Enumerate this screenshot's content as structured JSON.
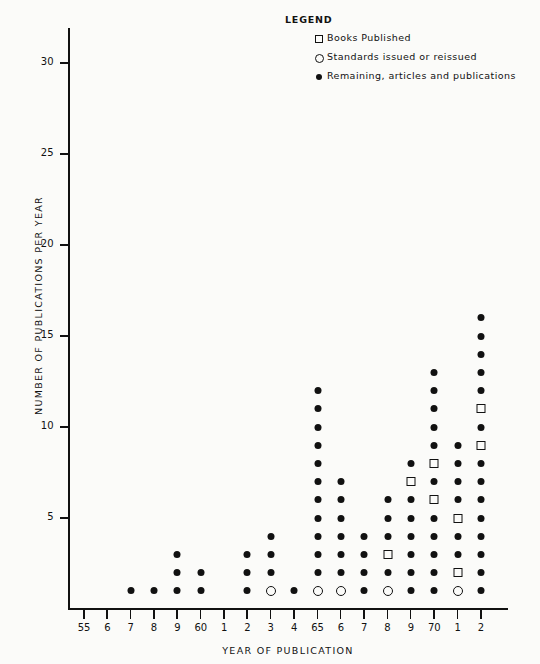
{
  "legend": {
    "title": "LEGEND",
    "entries": [
      {
        "marker": "square-marker",
        "label": "Books Published"
      },
      {
        "marker": "circle-marker",
        "label": "Standards issued or reissued"
      },
      {
        "marker": "dot-marker",
        "label": "Remaining, articles and publications"
      }
    ]
  },
  "chart_data": {
    "type": "scatter",
    "title": "",
    "xlabel": "YEAR OF PUBLICATION",
    "ylabel": "NUMBER OF PUBLICATIONS PER YEAR",
    "ylim": [
      0,
      33
    ],
    "yticks": [
      5,
      10,
      15,
      20,
      25,
      30
    ],
    "ytick_labels": [
      "5",
      "10",
      "15",
      "20",
      "25",
      "30"
    ],
    "grid": false,
    "legend_position": "top-right",
    "x": [
      1955,
      1956,
      1957,
      1958,
      1959,
      1960,
      1961,
      1962,
      1963,
      1964,
      1965,
      1966,
      1967,
      1968,
      1969,
      1970,
      1971,
      1972
    ],
    "xtick_labels": [
      "55",
      "6",
      "7",
      "8",
      "9",
      "60",
      "1",
      "2",
      "3",
      "4",
      "65",
      "6",
      "7",
      "8",
      "9",
      "70",
      "1",
      "2"
    ],
    "marker_types": [
      "dot",
      "square",
      "circle"
    ],
    "series": [
      {
        "name": "Total publications per year",
        "values": [
          0,
          0,
          1,
          1,
          3,
          2,
          0,
          3,
          4,
          1,
          12,
          7,
          4,
          6,
          8,
          13,
          9,
          16
        ]
      },
      {
        "name": "Books Published",
        "values": [
          0,
          0,
          0,
          0,
          0,
          0,
          0,
          0,
          0,
          0,
          0,
          0,
          0,
          1,
          1,
          2,
          2,
          2
        ]
      },
      {
        "name": "Standards issued or reissued",
        "values": [
          0,
          0,
          0,
          0,
          0,
          0,
          0,
          0,
          1,
          0,
          1,
          1,
          0,
          1,
          0,
          0,
          1,
          0
        ]
      },
      {
        "name": "Remaining, articles and publications",
        "values": [
          0,
          0,
          1,
          1,
          3,
          2,
          0,
          3,
          3,
          1,
          11,
          6,
          4,
          4,
          7,
          11,
          6,
          14
        ]
      }
    ],
    "columns": [
      {
        "year": "55",
        "stack": []
      },
      {
        "year": "6",
        "stack": []
      },
      {
        "year": "7",
        "stack": [
          "dot"
        ]
      },
      {
        "year": "8",
        "stack": [
          "dot"
        ]
      },
      {
        "year": "9",
        "stack": [
          "dot",
          "dot",
          "dot"
        ]
      },
      {
        "year": "60",
        "stack": [
          "dot",
          "dot"
        ]
      },
      {
        "year": "1",
        "stack": []
      },
      {
        "year": "2",
        "stack": [
          "dot",
          "dot",
          "dot"
        ]
      },
      {
        "year": "3",
        "stack": [
          "circle",
          "dot",
          "dot",
          "dot"
        ]
      },
      {
        "year": "4",
        "stack": [
          "dot"
        ]
      },
      {
        "year": "65",
        "stack": [
          "circle",
          "dot",
          "dot",
          "dot",
          "dot",
          "dot",
          "dot",
          "dot",
          "dot",
          "dot",
          "dot",
          "dot"
        ]
      },
      {
        "year": "6",
        "stack": [
          "circle",
          "dot",
          "dot",
          "dot",
          "dot",
          "dot",
          "dot"
        ]
      },
      {
        "year": "7",
        "stack": [
          "dot",
          "dot",
          "dot",
          "dot"
        ]
      },
      {
        "year": "8",
        "stack": [
          "circle",
          "dot",
          "square",
          "dot",
          "dot",
          "dot"
        ]
      },
      {
        "year": "9",
        "stack": [
          "dot",
          "dot",
          "dot",
          "dot",
          "dot",
          "dot",
          "square",
          "dot"
        ]
      },
      {
        "year": "70",
        "stack": [
          "dot",
          "dot",
          "dot",
          "dot",
          "dot",
          "square",
          "dot",
          "square",
          "dot",
          "dot",
          "dot",
          "dot",
          "dot"
        ]
      },
      {
        "year": "1",
        "stack": [
          "circle",
          "square",
          "dot",
          "dot",
          "square",
          "dot",
          "dot",
          "dot",
          "dot"
        ]
      },
      {
        "year": "2",
        "stack": [
          "dot",
          "dot",
          "dot",
          "dot",
          "dot",
          "dot",
          "dot",
          "dot",
          "square",
          "dot",
          "square",
          "dot",
          "dot",
          "dot",
          "dot",
          "dot"
        ]
      }
    ]
  }
}
